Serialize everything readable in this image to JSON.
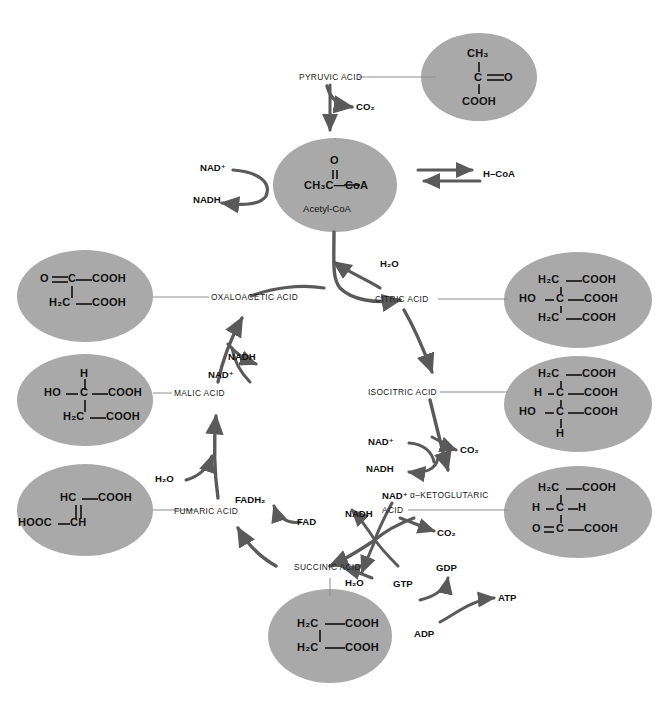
{
  "header": {
    "faint_text": ""
  },
  "diagram": {
    "ellipse_fill": "#a9a9a9",
    "arrow_color": "#555555",
    "line_color": "#8d8d8d",
    "text_color": "#111111"
  },
  "nodes": [
    {
      "id": "pyruvic",
      "label": "PYRUVIC ACID"
    },
    {
      "id": "acetylcoa",
      "label": "Acetyl-CoA"
    },
    {
      "id": "oxaloacetic",
      "label": "OXALOACETIC ACID"
    },
    {
      "id": "citric",
      "label": "CITRIC ACID"
    },
    {
      "id": "isocitric",
      "label": "ISOCITRIC ACID"
    },
    {
      "id": "ketoglutaric1",
      "label": "α–KETOGLUTARIC"
    },
    {
      "id": "ketoglutaric2",
      "label": "ACID"
    },
    {
      "id": "succinic",
      "label": "SUCCINIC ACID"
    },
    {
      "id": "fumaric",
      "label": "FUMARIC ACID"
    },
    {
      "id": "malic",
      "label": "MALIC ACID"
    }
  ],
  "cofactors": {
    "co2_pyruvate": "CO₂",
    "nad_acetyl": "NAD⁺",
    "nadh_acetyl": "NADH",
    "hcoa": "H–CoA",
    "h2o_citrate": "H₂O",
    "nad_isocitrate": "NAD⁺",
    "nadh_isocitrate": "NADH",
    "co2_isocitrate": "CO₂",
    "nad_ketoglutarate": "NAD⁺",
    "nadh_ketoglutarate": "NADH",
    "co2_ketoglutarate": "CO₂",
    "h2o_succinyl": "H₂O",
    "gdp": "GDP",
    "gtp": "GTP",
    "adp": "ADP",
    "atp": "ATP",
    "fad": "FAD",
    "fadh2": "FADH₂",
    "h2o_fumarate": "H₂O",
    "nad_malate": "NAD⁺",
    "nadh_malate": "NADH"
  },
  "structures": {
    "pyruvic": {
      "name": "pyruvic-acid-structure",
      "lines": [
        "CH₃",
        "C",
        "COOH"
      ],
      "formula_text": "CH3 - C(=O) - COOH"
    },
    "acetylcoa": {
      "name": "acetyl-coa-structure",
      "lines": [
        "O",
        "CH₃C—CoA"
      ],
      "caption": "Acetyl-CoA",
      "formula_text": "CH3-C(=O)-CoA"
    },
    "citric": {
      "name": "citric-acid-structure",
      "lines": [
        "H₂C—COOH",
        "HO—C—COOH",
        "H₂C—COOH"
      ],
      "formula_text": "H2C-COOH / HO-C-COOH / H2C-COOH"
    },
    "isocitric": {
      "name": "isocitric-acid-structure",
      "lines": [
        "H₂C—COOH",
        "H—C—COOH",
        "HO—C—COOH",
        "H"
      ],
      "formula_text": "H2C-COOH / H-C-COOH / HO-C-COOH / H"
    },
    "ketoglutaric": {
      "name": "alpha-ketoglutaric-acid-structure",
      "lines": [
        "H₂C—COOH",
        "H—C—H",
        "O=C—COOH"
      ],
      "formula_text": "H2C-COOH / H-C-H / O=C-COOH"
    },
    "succinic": {
      "name": "succinic-acid-structure",
      "lines": [
        "H₂C—COOH",
        "H₂C—COOH"
      ],
      "formula_text": "H2C-COOH / H2C-COOH"
    },
    "fumaric": {
      "name": "fumaric-acid-structure",
      "lines": [
        "HC—COOH",
        "HOOC—CH"
      ],
      "formula_text": "HC-COOH // HOOC-CH"
    },
    "malic": {
      "name": "malic-acid-structure",
      "lines": [
        "H",
        "HO—C—COOH",
        "H₂C—COOH"
      ],
      "formula_text": "H / HO-C-COOH / H2C-COOH"
    },
    "oxaloacetic": {
      "name": "oxaloacetic-acid-structure",
      "lines": [
        "O=C—COOH",
        "H₂C—COOH"
      ],
      "formula_text": "O=C-COOH / H2C-COOH"
    }
  }
}
